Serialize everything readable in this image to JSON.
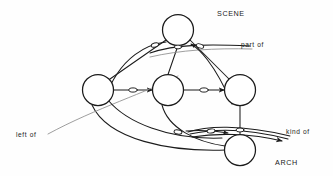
{
  "figure": {
    "type": "semantic-network-diagram",
    "background_color": "#fefefe",
    "stroke_color": "#1b1b1b",
    "labels": {
      "scene": "SCENE",
      "part_of": "part of",
      "left_of": "left of",
      "kind_of": "kind of",
      "arch": "ARCH"
    },
    "nodes": [
      {
        "id": "scene",
        "cx": 178,
        "cy": 30,
        "r": 15.5,
        "label": "SCENE"
      },
      {
        "id": "left-block",
        "cx": 98,
        "cy": 90,
        "r": 15.5,
        "label": ""
      },
      {
        "id": "mid-block",
        "cx": 168,
        "cy": 90,
        "r": 15.5,
        "label": ""
      },
      {
        "id": "right-block",
        "cx": 240,
        "cy": 90,
        "r": 15.5,
        "label": ""
      },
      {
        "id": "arch",
        "cx": 240,
        "cy": 150,
        "r": 15.5,
        "label": "ARCH"
      }
    ],
    "edges": [
      {
        "id": "scene-to-left",
        "from": "scene",
        "to": "left-block",
        "kind": "straight",
        "relation": "part of"
      },
      {
        "id": "scene-to-mid",
        "from": "scene",
        "to": "mid-block",
        "kind": "straight",
        "relation": "part of"
      },
      {
        "id": "scene-to-right",
        "from": "scene",
        "to": "right-block",
        "kind": "straight",
        "relation": "part of"
      },
      {
        "id": "left-to-mid",
        "from": "left-block",
        "to": "mid-block",
        "kind": "straight",
        "relation": "left of"
      },
      {
        "id": "mid-to-right",
        "from": "mid-block",
        "to": "right-block",
        "kind": "straight",
        "relation": "left of"
      },
      {
        "id": "right-to-arch",
        "from": "right-block",
        "to": "arch",
        "kind": "straight",
        "relation": "kind of"
      },
      {
        "id": "left-to-arch",
        "from": "left-block",
        "to": "arch",
        "kind": "curve",
        "relation": "kind of"
      },
      {
        "id": "mid-to-arch",
        "from": "mid-block",
        "to": "arch",
        "kind": "curve",
        "relation": "kind of"
      },
      {
        "id": "partof-arc-left",
        "from": "left-block",
        "to": "scene",
        "kind": "arc",
        "relation": "part of"
      },
      {
        "id": "partof-arc-right",
        "from": "right-block",
        "to": "scene",
        "kind": "arc",
        "relation": "part of"
      },
      {
        "id": "leftof-arc-long",
        "from": "left-block",
        "to": "right-block",
        "kind": "arc",
        "relation": "left of"
      },
      {
        "id": "kindof-arc",
        "from": "arch",
        "to": "kind-of",
        "kind": "arc",
        "relation": "kind of"
      }
    ]
  }
}
